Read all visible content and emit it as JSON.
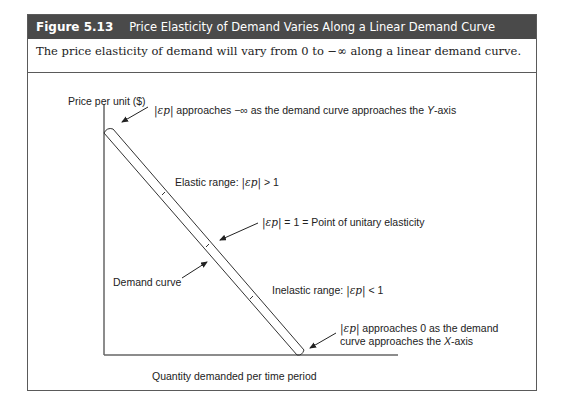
{
  "figure": {
    "number": "Figure 5.13",
    "title": "Price Elasticity of Demand Varies Along a Linear Demand Curve",
    "caption": "The price elasticity of demand will vary from 0 to −∞ along a linear demand curve."
  },
  "axes": {
    "ylabel": "Price per unit ($)",
    "xlabel": "Quantity demanded per time period"
  },
  "annotations": {
    "y_axis_end": {
      "symbol": "|εp|",
      "text_before": "approaches −∞ as the demand curve approaches the ",
      "axis_name": "Y",
      "text_after": "-axis"
    },
    "elastic": {
      "prefix": "Elastic range:",
      "symbol": "|εp|",
      "suffix": "> 1"
    },
    "unitary": {
      "symbol": "|εp|",
      "suffix": "= 1 = Point of unitary elasticity"
    },
    "demand_curve": {
      "label": "Demand curve"
    },
    "inelastic": {
      "prefix": "Inelastic range:",
      "symbol": "|εp|",
      "suffix": "< 1"
    },
    "x_axis_end": {
      "symbol": "|εp|",
      "line1": "approaches 0 as the demand",
      "line2_before": "curve approaches the ",
      "axis_name": "X",
      "line2_after": "-axis"
    }
  },
  "colors": {
    "header_bg": "#4a4a4a",
    "header_text": "#ffffff",
    "line": "#333333",
    "frame": "#5a5a5a"
  }
}
